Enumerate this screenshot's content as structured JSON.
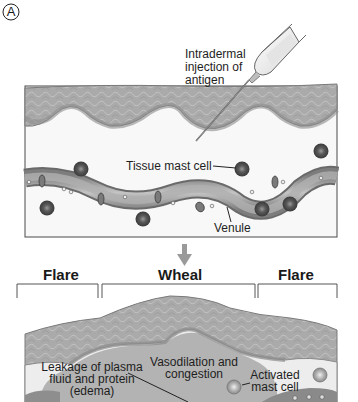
{
  "figure": {
    "panel_label": "A",
    "top_panel": {
      "labels": {
        "injection_line1": "Intradermal",
        "injection_line2": "injection of",
        "injection_line3": "antigen",
        "tissue_mast_cell": "Tissue mast cell",
        "venule": "Venule"
      }
    },
    "arrow": "down-arrow",
    "bottom_panel": {
      "regions": [
        {
          "label": "Flare"
        },
        {
          "label": "Wheal"
        },
        {
          "label": "Flare"
        }
      ],
      "labels": {
        "leakage_line1": "Leakage of plasma",
        "leakage_line2": "fluid and protein",
        "leakage_line3": "(edema)",
        "vasodilation_line1": "Vasodilation and",
        "vasodilation_line2": "congestion",
        "activated_line1": "Activated",
        "activated_line2": "mast cell"
      }
    },
    "colors": {
      "epidermis": "#a9a9a9",
      "epidermis_dark": "#8a8a8a",
      "dermis": "#f7f7f7",
      "vessel": "#9a9a9a",
      "edema": "#b5b5b5",
      "mast_cell": "#555555",
      "border": "#3a3a3a"
    }
  }
}
